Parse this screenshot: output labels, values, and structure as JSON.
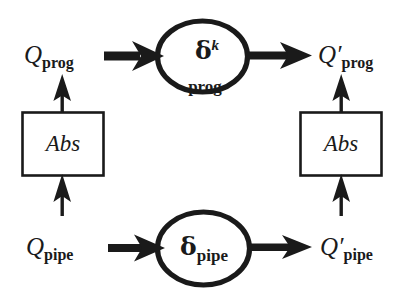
{
  "figure": {
    "background_color": "#ffffff",
    "ink_color": "#1a1a1a",
    "width": 401,
    "height": 301
  },
  "nodes": {
    "prog_node": {
      "symbol": "δ",
      "superscript": "k",
      "subscript": "prog",
      "shape": "ellipse"
    },
    "pipe_node": {
      "symbol": "δ",
      "superscript": "",
      "subscript": "pipe",
      "shape": "ellipse"
    },
    "abs_left": {
      "label": "Abs",
      "shape": "rectangle"
    },
    "abs_right": {
      "label": "Abs",
      "shape": "rectangle"
    }
  },
  "labels": {
    "q_prog": {
      "symbol": "Q",
      "prime": "",
      "subscript": "prog"
    },
    "q_prog_out": {
      "symbol": "Q",
      "prime": "′",
      "subscript": "prog"
    },
    "q_pipe": {
      "symbol": "Q",
      "prime": "",
      "subscript": "pipe"
    },
    "q_pipe_out": {
      "symbol": "Q",
      "prime": "′",
      "subscript": "pipe"
    }
  },
  "arrows": [
    {
      "name": "q-prog-to-delta-prog",
      "style": "thick-barbed",
      "direction": "right"
    },
    {
      "name": "delta-prog-to-q-prog-out",
      "style": "thick-barbed",
      "direction": "right"
    },
    {
      "name": "q-pipe-to-delta-pipe",
      "style": "thick-barbed",
      "direction": "right"
    },
    {
      "name": "delta-pipe-to-q-pipe-out",
      "style": "thick-barbed",
      "direction": "right"
    },
    {
      "name": "abs-left-to-q-prog",
      "style": "thin-barbed",
      "direction": "up"
    },
    {
      "name": "q-pipe-to-abs-left",
      "style": "thin-barbed",
      "direction": "up"
    },
    {
      "name": "abs-right-to-q-prog-out",
      "style": "thin-barbed",
      "direction": "up"
    },
    {
      "name": "q-pipe-out-to-abs-right",
      "style": "thin-barbed",
      "direction": "up"
    }
  ]
}
